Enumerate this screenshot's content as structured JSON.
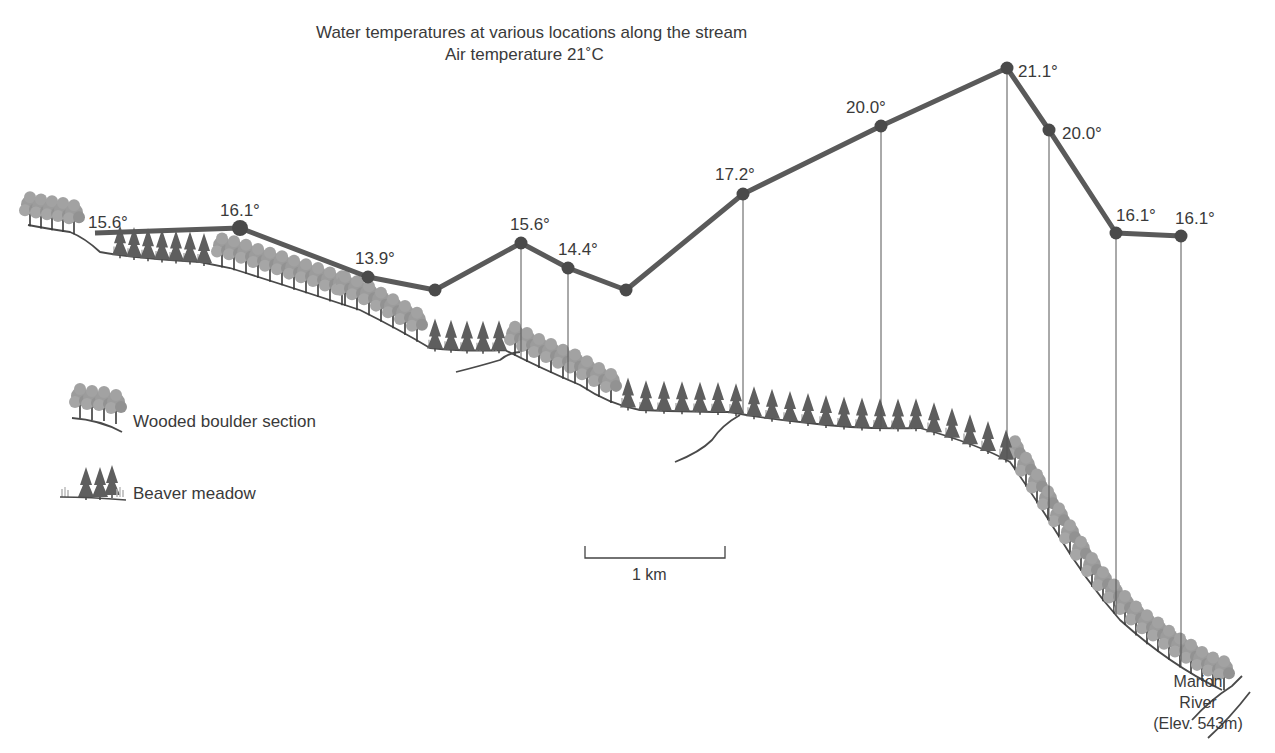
{
  "title": {
    "line1": "Water temperatures at various locations along the stream",
    "line2": "Air temperature 21˚C"
  },
  "colors": {
    "line": "#5a5a5a",
    "point": "#4a4a4a",
    "ground": "#4a4a4a",
    "deciduous": "#9a9a9a",
    "conifer": "#5c5c5c"
  },
  "chart_data": {
    "type": "line",
    "title": "Water temperatures at various locations along the stream",
    "subtitle": "Air temperature 21°C",
    "unit": "°C",
    "points": [
      {
        "label": "15.6°",
        "value": 15.6,
        "x": 95,
        "y": 233,
        "lx": 88,
        "ly": 228,
        "marker": false
      },
      {
        "label": "16.1°",
        "value": 16.1,
        "x": 240,
        "y": 228,
        "lx": 220,
        "ly": 216,
        "marker": true
      },
      {
        "label": "13.9°",
        "value": 13.9,
        "x": 368,
        "y": 277,
        "lx": 355,
        "ly": 264,
        "marker": true
      },
      {
        "label": "",
        "value": null,
        "x": 435,
        "y": 290,
        "lx": 0,
        "ly": 0,
        "marker": true
      },
      {
        "label": "15.6°",
        "value": 15.6,
        "x": 521,
        "y": 243,
        "lx": 510,
        "ly": 230,
        "marker": true
      },
      {
        "label": "14.4°",
        "value": 14.4,
        "x": 568,
        "y": 268,
        "lx": 558,
        "ly": 255,
        "marker": true
      },
      {
        "label": "",
        "value": null,
        "x": 626,
        "y": 290,
        "lx": 0,
        "ly": 0,
        "marker": true
      },
      {
        "label": "17.2°",
        "value": 17.2,
        "x": 743,
        "y": 194,
        "lx": 715,
        "ly": 180,
        "marker": true
      },
      {
        "label": "20.0°",
        "value": 20.0,
        "x": 881,
        "y": 126,
        "lx": 846,
        "ly": 113,
        "marker": true
      },
      {
        "label": "21.1°",
        "value": 21.1,
        "x": 1007,
        "y": 68,
        "lx": 1018,
        "ly": 77,
        "marker": true
      },
      {
        "label": "20.0°",
        "value": 20.0,
        "x": 1049,
        "y": 130,
        "lx": 1062,
        "ly": 139,
        "marker": true
      },
      {
        "label": "16.1°",
        "value": 16.1,
        "x": 1116,
        "y": 233,
        "lx": 1116,
        "ly": 221,
        "marker": true
      },
      {
        "label": "16.1°",
        "value": 16.1,
        "x": 1181,
        "y": 236,
        "lx": 1175,
        "ly": 224,
        "marker": true
      }
    ],
    "legend": [
      {
        "label": "Wooded boulder section",
        "symbol": "deciduous-trees"
      },
      {
        "label": "Beaver meadow",
        "symbol": "conifer-trees"
      }
    ],
    "scale_bar": "1 km",
    "annotation": "Marion River (Elev. 543m)",
    "grid": false
  },
  "legend": {
    "wooded": "Wooded boulder section",
    "meadow": "Beaver meadow"
  },
  "scale": {
    "label": "1 km"
  },
  "river": {
    "line1": "Marion",
    "line2": "River",
    "line3": "(Elev. 543m)"
  }
}
